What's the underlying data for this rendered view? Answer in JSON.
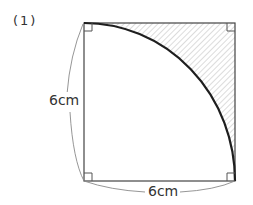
{
  "problem": {
    "label": "(1)"
  },
  "figure": {
    "shape": "square with quarter-circle arc",
    "square": {
      "x1": 84,
      "y1": 23,
      "x2": 235,
      "y2": 181
    },
    "arc": {
      "center": "bottom-left",
      "from": "top-left",
      "to": "bottom-right"
    },
    "shaded_region": "between arc and top-right corner",
    "right_angle_marks": [
      "top-left",
      "top-right",
      "bottom-left",
      "bottom-right"
    ]
  },
  "dimensions": {
    "left_side": "6cm",
    "bottom_side": "6cm"
  },
  "colors": {
    "line": "#333333",
    "arc": "#222222",
    "hatch": "#bbbbbb",
    "brace": "#888888"
  }
}
